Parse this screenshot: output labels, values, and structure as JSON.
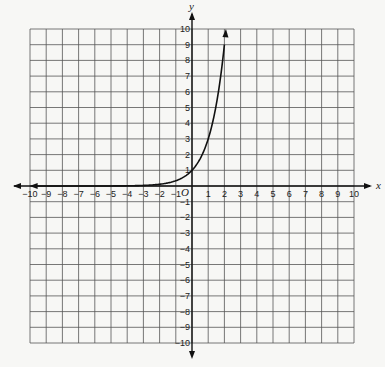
{
  "chart_data": {
    "type": "line",
    "title": "",
    "xlabel": "x",
    "ylabel": "y",
    "origin_label": "O",
    "xlim": [
      -10,
      10
    ],
    "ylim": [
      -10,
      10
    ],
    "grid": true,
    "x_ticks": [
      -10,
      -9,
      -8,
      -7,
      -6,
      -5,
      -4,
      -3,
      -2,
      -1,
      1,
      2,
      3,
      4,
      5,
      6,
      7,
      8,
      9,
      10
    ],
    "y_ticks": [
      10,
      9,
      8,
      7,
      6,
      5,
      4,
      3,
      2,
      1,
      -1,
      -2,
      -3,
      -4,
      -5,
      -6,
      -7,
      -8,
      -9,
      -10
    ],
    "series": [
      {
        "name": "y = 3^x",
        "function": "3^x",
        "x": [
          -10,
          -3,
          -2,
          -1,
          0,
          1,
          1.5,
          2,
          2.1
        ],
        "values": [
          0,
          0.04,
          0.11,
          0.33,
          1,
          3,
          5.2,
          9,
          10
        ],
        "color": "#111111",
        "arrows": "both"
      }
    ]
  }
}
